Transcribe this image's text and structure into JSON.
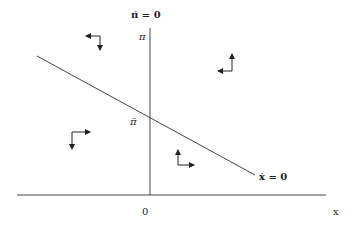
{
  "diagram": {
    "labels": {
      "pi_dot_locus": "π̇ = 0",
      "x_dot_locus": "ẋ = 0",
      "pi_axis": "π",
      "pi_bar": "π̄",
      "origin": "0",
      "x_axis": "x"
    },
    "loci": [
      {
        "name": "pi_dot_zero",
        "type": "vertical",
        "label": "π̇ = 0"
      },
      {
        "name": "x_dot_zero",
        "type": "downward-sloping",
        "label": "ẋ = 0"
      }
    ],
    "quadrant_arrows": [
      {
        "region": "upper-left",
        "horizontal": "left",
        "vertical": "down"
      },
      {
        "region": "upper-right",
        "horizontal": "left",
        "vertical": "up"
      },
      {
        "region": "lower-left",
        "horizontal": "right",
        "vertical": "down"
      },
      {
        "region": "lower-right",
        "horizontal": "right",
        "vertical": "up"
      }
    ],
    "colors": {
      "line": "#444444",
      "text": "#222222",
      "background": "#ffffff"
    }
  }
}
